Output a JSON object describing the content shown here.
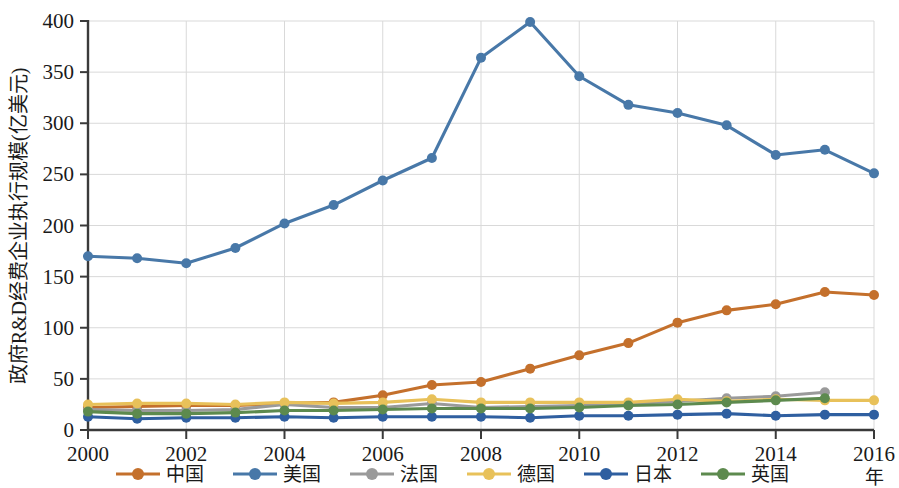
{
  "chart_data": {
    "type": "line",
    "title": "",
    "xlabel": "年",
    "ylabel": "政府R&D经费企业执行规模(亿美元)",
    "x": [
      2000,
      2001,
      2002,
      2003,
      2004,
      2005,
      2006,
      2007,
      2008,
      2009,
      2010,
      2011,
      2012,
      2013,
      2014,
      2015,
      2016
    ],
    "xticks": [
      "2000",
      "2002",
      "2004",
      "2006",
      "2008",
      "2010",
      "2012",
      "2014",
      "2016"
    ],
    "yticks": [
      "0",
      "50",
      "100",
      "150",
      "200",
      "250",
      "300",
      "350",
      "400"
    ],
    "xlim": [
      2000,
      2016
    ],
    "ylim": [
      0,
      400
    ],
    "grid": true,
    "legend_position": "bottom",
    "series": [
      {
        "name": "中国",
        "color": "#c4702c",
        "values": [
          22,
          23,
          24,
          24,
          26,
          27,
          34,
          44,
          47,
          60,
          73,
          85,
          105,
          117,
          123,
          135,
          132
        ]
      },
      {
        "name": "美国",
        "color": "#4878a8",
        "values": [
          170,
          168,
          163,
          178,
          202,
          220,
          244,
          266,
          364,
          399,
          346,
          318,
          310,
          298,
          269,
          274,
          251
        ]
      },
      {
        "name": "法国",
        "color": "#9a9a9a",
        "values": [
          20,
          19,
          19,
          20,
          25,
          22,
          22,
          26,
          22,
          23,
          24,
          26,
          28,
          31,
          33,
          37,
          null
        ]
      },
      {
        "name": "德国",
        "color": "#e8c15a",
        "values": [
          25,
          26,
          26,
          25,
          27,
          26,
          27,
          30,
          27,
          27,
          27,
          27,
          30,
          28,
          30,
          29,
          29
        ]
      },
      {
        "name": "日本",
        "color": "#2f5fa0",
        "values": [
          13,
          11,
          12,
          12,
          13,
          12,
          13,
          13,
          13,
          12,
          14,
          14,
          15,
          16,
          14,
          15,
          15
        ]
      },
      {
        "name": "英国",
        "color": "#5d8a4e",
        "values": [
          18,
          16,
          16,
          17,
          19,
          19,
          20,
          21,
          21,
          21,
          22,
          24,
          25,
          27,
          29,
          31,
          null
        ]
      }
    ]
  },
  "legend": {
    "items": [
      {
        "label": "中国",
        "color": "#c4702c"
      },
      {
        "label": "美国",
        "color": "#4878a8"
      },
      {
        "label": "法国",
        "color": "#9a9a9a"
      },
      {
        "label": "德国",
        "color": "#e8c15a"
      },
      {
        "label": "日本",
        "color": "#2f5fa0"
      },
      {
        "label": "英国",
        "color": "#5d8a4e"
      }
    ]
  },
  "axis": {
    "y_title": "政府R&D经费企业执行规模(亿美元)",
    "x_unit": "年"
  }
}
